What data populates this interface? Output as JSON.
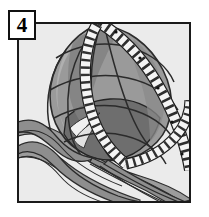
{
  "figure": {
    "kind": "instructional-line-illustration",
    "step_number": "4",
    "caption": "",
    "palette": {
      "page_background": "#ffffff",
      "panel_background": "#ebebeb",
      "panel_border": "#1a1a1a",
      "ink": "#2b2b2b",
      "dome_midtone": "#9a9a9a",
      "dome_shadow": "#6e6e6e",
      "dome_deep_shadow": "#5a5a5a",
      "ribbon_fill": "#8e8e8e",
      "strap_fill": "#f2f2f2",
      "strap_stitch": "#1a1a1a",
      "badge_background": "#ffffff",
      "badge_border": "#111111",
      "badge_text": "#000000"
    },
    "panel": {
      "x": 17,
      "y": 22,
      "width": 174,
      "height": 181,
      "border_width": 2
    },
    "elements": [
      {
        "name": "dome-body",
        "description": "rounded balloon-like dome occupying centre of panel"
      },
      {
        "name": "netting",
        "description": "criss-cross net lines over the dome"
      },
      {
        "name": "measuring-strap",
        "description": "light dashed-stitched band looping over the dome from apex to lower right"
      },
      {
        "name": "trailing-ribbons",
        "description": "wavy ribbon strands flowing to lower left and lower right"
      }
    ]
  },
  "badge": {
    "label": "4",
    "aria": "step-four"
  }
}
